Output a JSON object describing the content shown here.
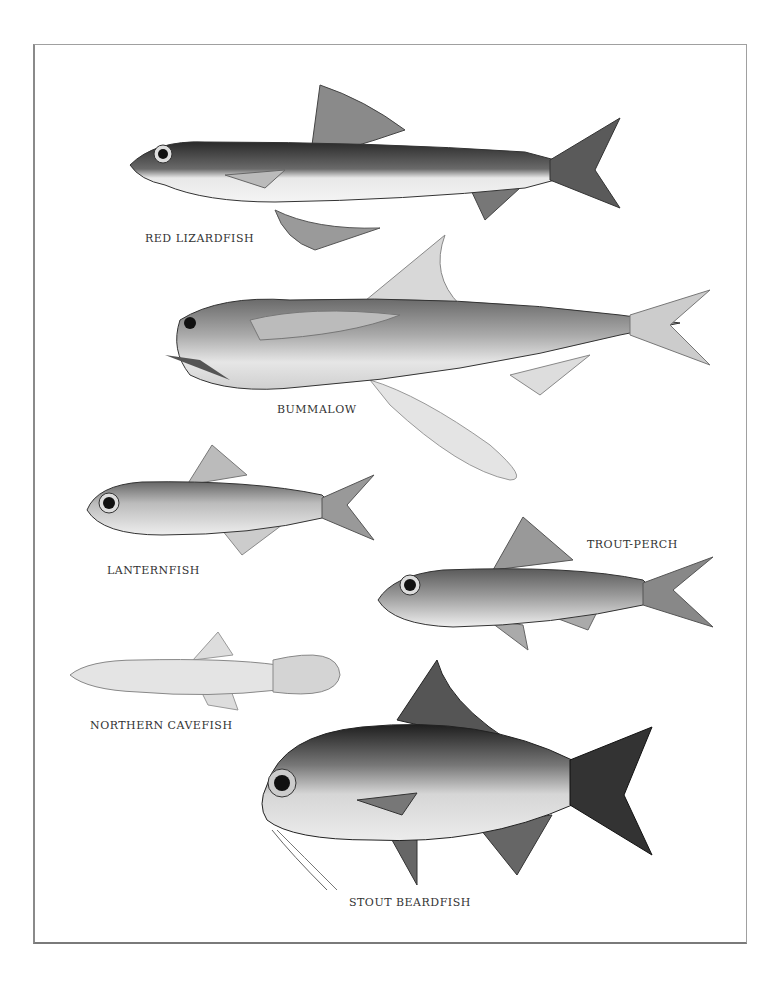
{
  "plate": {
    "fish": [
      {
        "name": "RED LIZARDFISH"
      },
      {
        "name": "BUMMALOW"
      },
      {
        "name": "LANTERNFISH"
      },
      {
        "name": "TROUT-PERCH"
      },
      {
        "name": "NORTHERN CAVEFISH"
      },
      {
        "name": "STOUT BEARDFISH"
      }
    ]
  }
}
